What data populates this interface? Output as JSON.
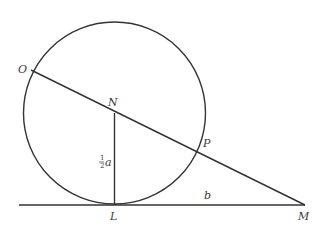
{
  "diagram": {
    "type": "geometry",
    "points": {
      "O": {
        "label": "O",
        "x": 31,
        "y": 70
      },
      "N": {
        "label": "N",
        "x": 114,
        "y": 113
      },
      "P": {
        "label": "P",
        "x": 196,
        "y": 152
      },
      "L": {
        "label": "L",
        "x": 114,
        "y": 205
      },
      "M": {
        "label": "M",
        "x": 305,
        "y": 205
      }
    },
    "circle": {
      "cx": 114.5,
      "cy": 113,
      "r": 91
    },
    "segment_labels": {
      "NL": {
        "numerator": "1",
        "denominator": "2",
        "variable": "a"
      },
      "LM": {
        "text": "b"
      }
    },
    "stroke_color": "#333333"
  }
}
